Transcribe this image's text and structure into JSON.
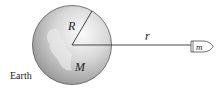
{
  "diagram": {
    "earth_label": "Earth",
    "radius_label": "R",
    "mass_label": "M",
    "distance_label": "r",
    "satellite_label": "m",
    "colors": {
      "sphere_light": "#f4f4f4",
      "sphere_dark": "#8c8c8c",
      "line": "#333333"
    }
  }
}
